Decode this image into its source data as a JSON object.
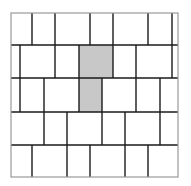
{
  "diagram": {
    "title": "",
    "frame": {
      "x0": 11,
      "y0": 13,
      "x1": 178,
      "y1": 177,
      "stroke": "#9a9a9a"
    },
    "line_color": "#1a1a1a",
    "shade_color": "#c8c8c8",
    "rows": [
      {
        "y0": 13,
        "y1": 45,
        "dividers": [
          32,
          55,
          90,
          113,
          148,
          172
        ]
      },
      {
        "y0": 45,
        "y1": 78,
        "dividers": [
          20,
          55,
          79,
          113,
          136,
          172
        ]
      },
      {
        "y0": 78,
        "y1": 112,
        "dividers": [
          20,
          44,
          79,
          102,
          136,
          160
        ]
      },
      {
        "y0": 112,
        "y1": 145,
        "dividers": [
          44,
          67,
          102,
          125,
          160
        ]
      },
      {
        "y0": 145,
        "y1": 177,
        "dividers": [
          32,
          67,
          90,
          125,
          148
        ]
      }
    ],
    "shaded_tiles": [
      {
        "row": 2,
        "x0": 79,
        "x1": 113
      },
      {
        "row": 3,
        "x0": 79,
        "x1": 102
      }
    ]
  }
}
